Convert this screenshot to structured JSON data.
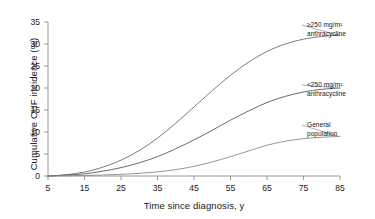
{
  "chart_data": {
    "type": "line",
    "title": "",
    "xlabel": "Time since diagnosis, y",
    "ylabel": "Cumulative CHF incidence (%)",
    "xlim": [
      5,
      85
    ],
    "ylim": [
      0,
      35
    ],
    "xticks": [
      "5",
      "15",
      "25",
      "35",
      "45",
      "55",
      "65",
      "75",
      "85"
    ],
    "yticks": [
      "0",
      "5",
      "10",
      "15",
      "20",
      "25",
      "30",
      "35"
    ],
    "grid": false,
    "legend_position": "right-inline-annotations",
    "x": [
      5,
      10,
      15,
      20,
      25,
      30,
      35,
      40,
      45,
      50,
      55,
      60,
      65,
      70,
      75,
      80,
      85
    ],
    "series": [
      {
        "name": "≥250 mg/m² anthracycline",
        "label_line1": "≥250 mg/m²",
        "label_line2": "anthracycline",
        "color": "#6e6e6e",
        "values": [
          0,
          0.3,
          0.9,
          2.0,
          3.6,
          5.8,
          8.6,
          12.0,
          15.7,
          19.4,
          22.9,
          25.9,
          28.3,
          30.0,
          31.1,
          31.7,
          32.0
        ]
      },
      {
        "name": "<250 mg/m² anthracycline",
        "label_line1": "<250 mg/m²",
        "label_line2": "anthracycline",
        "color": "#5a5a5a",
        "values": [
          0,
          0.2,
          0.5,
          1.1,
          1.9,
          3.0,
          4.4,
          6.2,
          8.2,
          10.4,
          12.7,
          14.8,
          16.7,
          18.1,
          19.1,
          19.7,
          20.0
        ]
      },
      {
        "name": "General population",
        "label_line1": "General",
        "label_line2": "population",
        "color": "#8a8a8a",
        "values": [
          0,
          0.05,
          0.12,
          0.22,
          0.38,
          0.6,
          0.95,
          1.45,
          2.2,
          3.2,
          4.4,
          5.7,
          7.0,
          7.9,
          8.5,
          8.8,
          9.0
        ]
      }
    ]
  }
}
